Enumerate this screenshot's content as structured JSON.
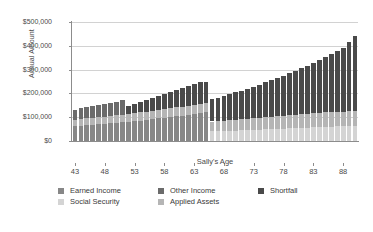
{
  "chart_data": {
    "type": "bar",
    "subtype": "stacked-column",
    "title": "",
    "xlabel": "Sally's Age",
    "ylabel": "Annual Amount",
    "ylim": [
      0,
      500000
    ],
    "ytick_labels": [
      "$0",
      "$100,000",
      "$200,000",
      "$300,000",
      "$400,000",
      "$500,000"
    ],
    "ytick_values": [
      0,
      100000,
      200000,
      300000,
      400000,
      500000
    ],
    "xtick_labels": [
      "43",
      "48",
      "53",
      "58",
      "63",
      "68",
      "73",
      "78",
      "83",
      "88"
    ],
    "xtick_values": [
      43,
      48,
      53,
      58,
      63,
      68,
      73,
      78,
      83,
      88
    ],
    "grid": "horizontal",
    "legend_position": "bottom",
    "categories": [
      43,
      44,
      45,
      46,
      47,
      48,
      49,
      50,
      51,
      52,
      53,
      54,
      55,
      56,
      57,
      58,
      59,
      60,
      61,
      62,
      63,
      64,
      65,
      66,
      67,
      68,
      69,
      70,
      71,
      72,
      73,
      74,
      75,
      76,
      77,
      78,
      79,
      80,
      81,
      82,
      83,
      84,
      85,
      86,
      87,
      88,
      89,
      90
    ],
    "series": [
      {
        "name": "Earned Income",
        "color": "#878787",
        "values": [
          62000,
          64000,
          66000,
          68000,
          70000,
          72000,
          74000,
          76000,
          79000,
          81000,
          84000,
          86000,
          89000,
          92000,
          95000,
          98000,
          101000,
          104000,
          107000,
          111000,
          114000,
          118000,
          122000,
          0,
          0,
          0,
          0,
          0,
          0,
          0,
          0,
          0,
          0,
          0,
          0,
          0,
          0,
          0,
          0,
          0,
          0,
          0,
          0,
          0,
          0,
          0,
          0,
          0
        ]
      },
      {
        "name": "Social Security",
        "color": "#d4d4d4",
        "values": [
          0,
          0,
          0,
          0,
          0,
          0,
          0,
          0,
          0,
          0,
          0,
          0,
          0,
          0,
          0,
          0,
          0,
          0,
          0,
          0,
          0,
          0,
          0,
          40000,
          41000,
          42000,
          43000,
          44000,
          45000,
          46000,
          47000,
          48000,
          49000,
          50000,
          51000,
          52000,
          53000,
          54000,
          55000,
          56000,
          57000,
          58000,
          59000,
          60000,
          61000,
          62000,
          63000,
          64000
        ]
      },
      {
        "name": "Applied Assets",
        "color": "#b5b5b5",
        "values": [
          28000,
          29000,
          29000,
          30000,
          30000,
          31000,
          31000,
          32000,
          32000,
          33000,
          33000,
          34000,
          34000,
          35000,
          35000,
          36000,
          36000,
          37000,
          37000,
          38000,
          38000,
          39000,
          39000,
          42000,
          43000,
          44000,
          45000,
          46000,
          47000,
          48000,
          49000,
          50000,
          51000,
          52000,
          53000,
          54000,
          55000,
          56000,
          57000,
          58000,
          59000,
          60000,
          61000,
          62000,
          62000,
          62000,
          62000,
          62000
        ]
      },
      {
        "name": "Other Income",
        "color": "#6b6b6b",
        "values": [
          42000,
          44000,
          46000,
          48000,
          51000,
          53000,
          56000,
          58000,
          61000,
          0,
          0,
          0,
          0,
          0,
          0,
          0,
          0,
          0,
          0,
          0,
          0,
          0,
          0,
          0,
          0,
          0,
          0,
          0,
          0,
          0,
          0,
          0,
          0,
          0,
          0,
          0,
          0,
          0,
          0,
          0,
          0,
          0,
          0,
          0,
          0,
          0,
          0,
          0
        ]
      },
      {
        "name": "Shortfall",
        "color": "#4a4a4a",
        "values": [
          0,
          0,
          0,
          0,
          0,
          0,
          0,
          0,
          0,
          33000,
          38000,
          44000,
          49000,
          55000,
          60000,
          65000,
          70000,
          75000,
          80000,
          84000,
          89000,
          93000,
          88000,
          93000,
          98000,
          103000,
          108000,
          114000,
          120000,
          126000,
          132000,
          139000,
          146000,
          153000,
          160000,
          168000,
          176000,
          184000,
          193000,
          202000,
          212000,
          222000,
          232000,
          243000,
          254000,
          266000,
          289000,
          314000
        ]
      }
    ],
    "stack_order": [
      "Earned Income",
      "Social Security",
      "Applied Assets",
      "Other Income",
      "Shortfall"
    ],
    "totals": [
      132000,
      137000,
      141000,
      146000,
      151000,
      156000,
      161000,
      166000,
      172000,
      147000,
      155000,
      164000,
      172000,
      182000,
      190000,
      199000,
      207000,
      216000,
      224000,
      233000,
      241000,
      250000,
      249000,
      175000,
      182000,
      189000,
      196000,
      204000,
      212000,
      220000,
      228000,
      237000,
      246000,
      255000,
      264000,
      274000,
      284000,
      294000,
      305000,
      316000,
      328000,
      340000,
      352000,
      365000,
      377000,
      390000,
      414000,
      440000
    ]
  },
  "legend": {
    "items": [
      {
        "label": "Earned Income",
        "color": "#878787"
      },
      {
        "label": "Other Income",
        "color": "#6b6b6b"
      },
      {
        "label": "Shortfall",
        "color": "#4a4a4a"
      },
      {
        "label": "Social Security",
        "color": "#d4d4d4"
      },
      {
        "label": "Applied Assets",
        "color": "#b5b5b5"
      }
    ]
  }
}
